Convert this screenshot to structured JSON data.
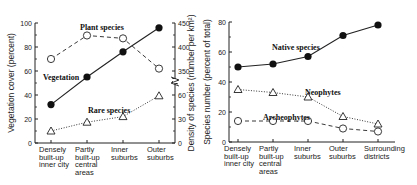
{
  "chart_data": [
    {
      "type": "line",
      "categories": [
        "Densely built-up inner city",
        "Partly built-up central areas",
        "Inner suburbs",
        "Outer suburbs"
      ],
      "category_lines": [
        [
          "Densely",
          "built-up",
          "inner city"
        ],
        [
          "Partly",
          "built-up",
          "central",
          "areas"
        ],
        [
          "Inner",
          "suburbs"
        ],
        [
          "Outer",
          "suburbs"
        ]
      ],
      "ylabel_left": "Vegetation cover (percent)",
      "ylabel_right": "Density of species (number per km²)",
      "left_ticks": [
        "0",
        "20",
        "40",
        "60",
        "80",
        "100"
      ],
      "right_ticks_lower": [
        "0",
        "30",
        "60"
      ],
      "right_ticks_upper": [
        "350",
        "400",
        "450"
      ],
      "ylim_left": [
        0,
        100
      ],
      "axis_break": true,
      "series": [
        {
          "name": "Vegetation",
          "axis": "left",
          "values": [
            32,
            55,
            76,
            96
          ],
          "marker": "filled-circle",
          "line": "solid"
        },
        {
          "name": "Plant species",
          "axis": "right-upper",
          "values": [
            375,
            424,
            418,
            355
          ],
          "marker": "open-circle",
          "line": "dashed"
        },
        {
          "name": "Rare species",
          "axis": "right-lower",
          "values": [
            15,
            26,
            33,
            59
          ],
          "marker": "open-triangle",
          "line": "dotted"
        }
      ]
    },
    {
      "type": "line",
      "categories": [
        "Densely built-up inner city",
        "Partly built-up central areas",
        "Inner suburbs",
        "Outer suburbs",
        "Surrounding districts"
      ],
      "category_lines": [
        [
          "Densely",
          "built-up",
          "inner city"
        ],
        [
          "Partly",
          "built-up",
          "central",
          "areas"
        ],
        [
          "Inner",
          "suburbs"
        ],
        [
          "Outer",
          "suburbs"
        ],
        [
          "Surrounding",
          "districts"
        ]
      ],
      "ylabel": "Species number (percent of total)",
      "ticks": [
        "0",
        "20",
        "40",
        "60",
        "80"
      ],
      "ylim": [
        0,
        80
      ],
      "series": [
        {
          "name": "Native species",
          "values": [
            50,
            52,
            57,
            71,
            78
          ],
          "marker": "filled-circle",
          "line": "solid"
        },
        {
          "name": "Neophytes",
          "values": [
            35,
            33,
            30,
            17,
            12
          ],
          "marker": "open-triangle",
          "line": "dotted"
        },
        {
          "name": "Archeophytes",
          "values": [
            14,
            14,
            14,
            9,
            7
          ],
          "marker": "open-circle",
          "line": "dashed"
        }
      ]
    }
  ]
}
